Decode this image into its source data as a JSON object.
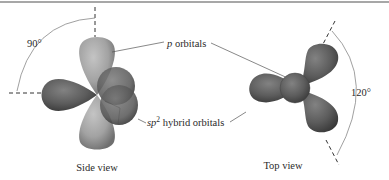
{
  "figure": {
    "side_view": {
      "caption": "Side view",
      "angle_label": "90°"
    },
    "top_view": {
      "caption": "Top view",
      "angle_label": "120°"
    },
    "labels": {
      "p_orbitals_prefix": "p",
      "p_orbitals_suffix": " orbitals",
      "sp2_prefix": "sp",
      "sp2_superscript": "2",
      "sp2_suffix": " hybrid orbitals"
    },
    "colors": {
      "p_orbital_light": "#a3a3a3",
      "hybrid_dark": "#5a5a5a",
      "border": "#8a8a8a"
    }
  }
}
